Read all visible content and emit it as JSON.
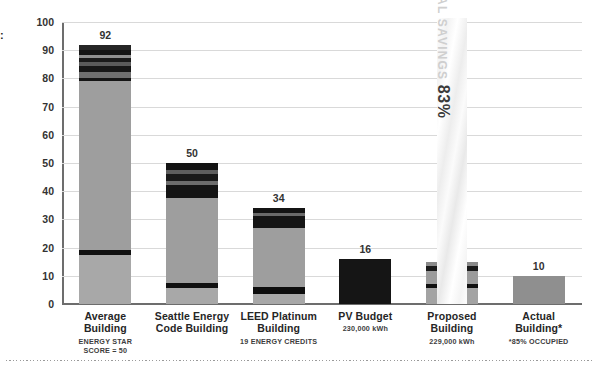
{
  "edge_glyph": ":",
  "chart_data": {
    "type": "bar",
    "subtype": "stacked-bar",
    "title": "",
    "xlabel": "",
    "ylabel": "",
    "ylim": [
      0,
      100
    ],
    "ytick_step": 10,
    "yticks": [
      "100",
      "90",
      "80",
      "70",
      "60",
      "50",
      "40",
      "30",
      "20",
      "10",
      "0"
    ],
    "grid": true,
    "legend": "none",
    "units_note": "kBtu/sf/yr (Energy Use Intensity)",
    "categories": [
      "Average Building",
      "Seattle Energy Code Building",
      "LEED Platinum Building",
      "PV Budget",
      "Proposed Building",
      "Actual Building*"
    ],
    "values": [
      92,
      50,
      34,
      16,
      15,
      10
    ],
    "value_labels": [
      "92",
      "50",
      "34",
      "16",
      "",
      "10"
    ],
    "series": [
      {
        "name": "Average Building",
        "total": 92,
        "segments": [
          {
            "value": 17.5,
            "color": "#a8a8a8"
          },
          {
            "value": 1.8,
            "color": "#121212"
          },
          {
            "value": 59.7,
            "color": "#9e9e9e"
          },
          {
            "value": 1.2,
            "color": "#151515"
          },
          {
            "value": 2.0,
            "color": "#6f6f6f"
          },
          {
            "value": 2.2,
            "color": "#171717"
          },
          {
            "value": 1.6,
            "color": "#5a5a5a"
          },
          {
            "value": 1.4,
            "color": "#1a1a1a"
          },
          {
            "value": 1.1,
            "color": "#8f8f8f"
          },
          {
            "value": 1.6,
            "color": "#141414"
          },
          {
            "value": 1.9,
            "color": "#262626"
          }
        ]
      },
      {
        "name": "Seattle Energy Code Building",
        "total": 50,
        "segments": [
          {
            "value": 5.6,
            "color": "#a8a8a8"
          },
          {
            "value": 1.9,
            "color": "#101010"
          },
          {
            "value": 30.0,
            "color": "#9e9e9e"
          },
          {
            "value": 4.6,
            "color": "#141414"
          },
          {
            "value": 1.6,
            "color": "#6c6c6c"
          },
          {
            "value": 2.4,
            "color": "#1a1a1a"
          },
          {
            "value": 1.3,
            "color": "#5e5e5e"
          },
          {
            "value": 2.6,
            "color": "#131313"
          }
        ]
      },
      {
        "name": "LEED Platinum Building",
        "total": 34,
        "segments": [
          {
            "value": 3.5,
            "color": "#a8a8a8"
          },
          {
            "value": 2.4,
            "color": "#0e0e0e"
          },
          {
            "value": 21.0,
            "color": "#9e9e9e"
          },
          {
            "value": 4.4,
            "color": "#151515"
          },
          {
            "value": 1.1,
            "color": "#6a6a6a"
          },
          {
            "value": 1.6,
            "color": "#141414"
          }
        ]
      },
      {
        "name": "PV Budget",
        "total": 16,
        "segments": [
          {
            "value": 16.0,
            "color": "#151515"
          }
        ]
      },
      {
        "name": "Proposed Building",
        "total": 15,
        "segments": [
          {
            "value": 5.6,
            "color": "#a3a3a3"
          },
          {
            "value": 1.4,
            "color": "#101010"
          },
          {
            "value": 4.8,
            "color": "#9b9b9b"
          },
          {
            "value": 1.6,
            "color": "#1b1b1b"
          },
          {
            "value": 1.6,
            "color": "#8a8a8a"
          }
        ]
      },
      {
        "name": "Actual Building*",
        "total": 10,
        "segments": [
          {
            "value": 10.0,
            "color": "#8f8f8f"
          }
        ]
      }
    ],
    "annotations": [
      {
        "name": "total-savings-band",
        "label": "TOTAL SAVINGS",
        "value": "83%",
        "spans_categories": [
          "Proposed Building"
        ]
      }
    ]
  },
  "categories_detail": [
    {
      "title": "Average Building",
      "sub": [
        "ENERGY STAR",
        "SCORE = 50"
      ],
      "label": "92"
    },
    {
      "title": "Seattle Energy\nCode Building",
      "sub": [],
      "label": "50"
    },
    {
      "title": "LEED Platinum\nBuilding",
      "sub": [
        "19 ENERGY CREDITS"
      ],
      "label": "34"
    },
    {
      "title": "PV Budget",
      "sub": [
        "230,000 kWh"
      ],
      "label": "16"
    },
    {
      "title": "Proposed Building",
      "sub": [
        "229,000 kWh"
      ],
      "label": ""
    },
    {
      "title": "Actual Building*",
      "sub": [
        "*85% OCCUPIED"
      ],
      "label": "10"
    }
  ],
  "cat_lines": [
    [
      "Average Building"
    ],
    [
      "Seattle Energy",
      "Code Building"
    ],
    [
      "LEED Platinum",
      "Building"
    ],
    [
      "PV Budget"
    ],
    [
      "Proposed Building"
    ],
    [
      "Actual Building*"
    ]
  ],
  "cat_subs": [
    [
      "ENERGY STAR",
      "SCORE = 50"
    ],
    [],
    [
      "19 ENERGY CREDITS"
    ],
    [
      "230,000 kWh"
    ],
    [
      "229,000 kWh"
    ],
    [
      "*85% OCCUPIED"
    ]
  ],
  "savings": {
    "label": "TOTAL SAVINGS",
    "value": "83%"
  },
  "colors": {
    "axis": "#6d6d6d",
    "grid": "#d9d9d9",
    "text": "#2b2b2b",
    "bar_light": "#a8a8a8",
    "bar_mid": "#6f6f6f",
    "bar_dark": "#141414"
  }
}
